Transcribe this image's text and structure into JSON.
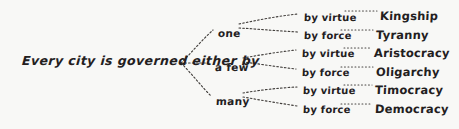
{
  "diagram": {
    "type": "tree",
    "title": "Every city is governed either by",
    "root": {
      "label": "Every city is governed either by",
      "x": 22,
      "y": 55
    },
    "branches": [
      {
        "label": "one",
        "x": 218,
        "y": 28,
        "children": [
          {
            "mode": "by virtue",
            "outcome": "Kingship",
            "mode_x": 304,
            "mode_y": 13,
            "outcome_x": 380,
            "outcome_y": 11
          },
          {
            "mode": "by force",
            "outcome": "Tyranny",
            "mode_x": 304,
            "mode_y": 31,
            "outcome_x": 376,
            "outcome_y": 30
          }
        ]
      },
      {
        "label": "a few",
        "x": 215,
        "y": 62,
        "children": [
          {
            "mode": "by virtue",
            "outcome": "Aristocracy",
            "mode_x": 302,
            "mode_y": 49,
            "outcome_x": 374,
            "outcome_y": 48
          },
          {
            "mode": "by force",
            "outcome": "Oligarchy",
            "mode_x": 302,
            "mode_y": 68,
            "outcome_x": 376,
            "outcome_y": 67
          }
        ]
      },
      {
        "label": "many",
        "x": 216,
        "y": 96,
        "children": [
          {
            "mode": "by virtue",
            "outcome": "Timocracy",
            "mode_x": 303,
            "mode_y": 86,
            "outcome_x": 375,
            "outcome_y": 85
          },
          {
            "mode": "by force",
            "outcome": "Democracy",
            "mode_x": 303,
            "mode_y": 105,
            "outcome_x": 375,
            "outcome_y": 104
          }
        ]
      }
    ],
    "colors": {
      "background": "#f8f8f6",
      "ink": "#23201e"
    }
  }
}
